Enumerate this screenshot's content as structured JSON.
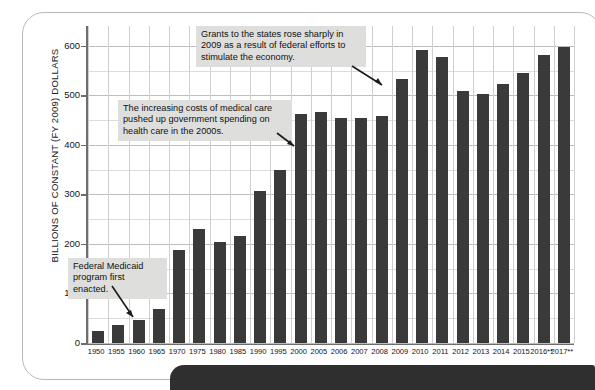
{
  "chart_data": {
    "type": "bar",
    "title": "",
    "xlabel": "",
    "ylabel": "BILLIONS OF CONSTANT (FY 2009) DOLLARS",
    "ylim": [
      0,
      640
    ],
    "yticks": [
      0,
      100,
      200,
      300,
      400,
      500,
      600
    ],
    "ytick_labels": [
      "0",
      "100",
      "200",
      "300",
      "400",
      "500",
      "600"
    ],
    "grid": true,
    "legend": "none",
    "bar_color": "#3a3a3a",
    "categories": [
      "1950",
      "1955",
      "1960",
      "1965",
      "1970",
      "1975",
      "1980",
      "1985",
      "1990",
      "1995",
      "2000",
      "2005",
      "2006",
      "2007",
      "2008",
      "2009",
      "2010",
      "2011",
      "2012",
      "2013",
      "2014",
      "2015",
      "2016**",
      "2017**"
    ],
    "values": [
      24,
      37,
      47,
      69,
      188,
      230,
      203,
      216,
      307,
      349,
      462,
      466,
      455,
      454,
      458,
      533,
      591,
      577,
      508,
      503,
      523,
      545,
      582,
      597
    ],
    "annotations": [
      {
        "id": "grants",
        "text": "Grants to the states rose sharply in\n2009 as a result of federal efforts to\nstimulate the economy.",
        "points_to": "2009"
      },
      {
        "id": "medical",
        "text": "The increasing costs of medical care\npushed up government spending on\nhealth care in the 2000s.",
        "points_to": "2000"
      },
      {
        "id": "medicaid",
        "text": "Federal Medicaid\nprogram first enacted.",
        "points_to": "1965"
      }
    ]
  }
}
